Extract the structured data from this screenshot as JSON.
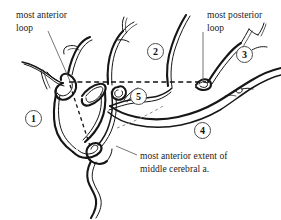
{
  "figure": {
    "background_color": "#ffffff",
    "ink_color": "#161616",
    "width": 281,
    "height": 220
  },
  "labels": {
    "anterior_loop": {
      "line1": "most anterior",
      "line2": "loop"
    },
    "posterior_loop": {
      "line1": "most posterior",
      "line2": "loop"
    },
    "mca_extent": {
      "line1": "most anterior extent of",
      "line2": "middle cerebral a."
    }
  },
  "markers": [
    {
      "id": "marker-1",
      "value": "1",
      "x": 25,
      "y": 110
    },
    {
      "id": "marker-2",
      "value": "2",
      "x": 147,
      "y": 43
    },
    {
      "id": "marker-3",
      "value": "3",
      "x": 236,
      "y": 46
    },
    {
      "id": "marker-4",
      "value": "4",
      "x": 194,
      "y": 122
    },
    {
      "id": "marker-5",
      "value": "5",
      "x": 130,
      "y": 88
    }
  ],
  "annotations": {
    "reference_line": "horizontal dashed reference line",
    "measure_line": "dashed diagonal measurement line",
    "faint_line": "faint dashed guide line"
  }
}
